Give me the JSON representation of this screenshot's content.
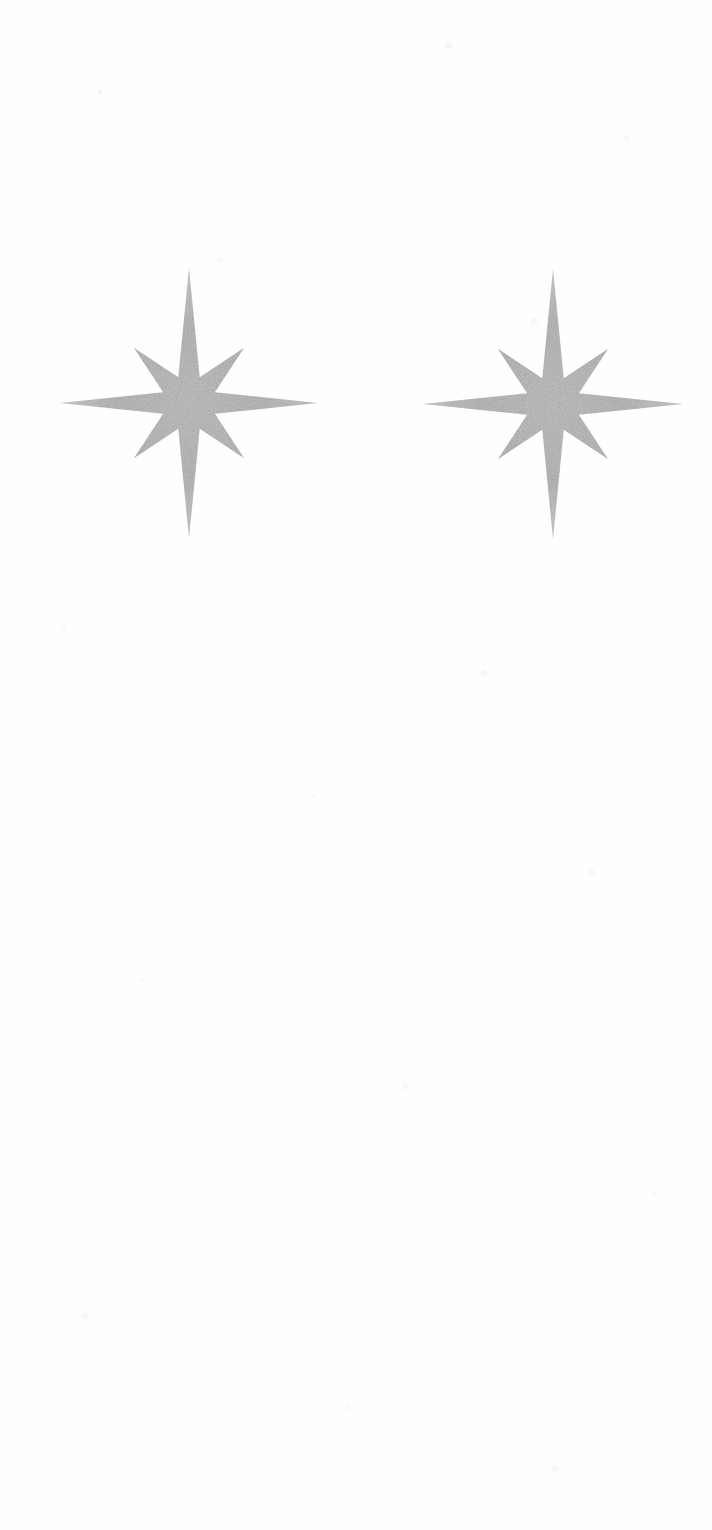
{
  "canvas": {
    "width": 712,
    "height": 1530,
    "background_color": "#fefeff",
    "paper_texture": "faint-scanned-paper-mottling"
  },
  "artwork": {
    "title": "Two eight-pointed sparkle stars",
    "description": "Two identical grainy grey eight-pointed sparkle glyphs side by side on a near-white scanned page, upper third of the sheet.",
    "item_count": 2,
    "fill_color": "#b9b9bb",
    "fill_color_light": "#d2d2d5",
    "fill_color_dark": "#a6a6a9",
    "texture": "grainy-speckled-grey"
  },
  "stars": [
    {
      "name": "sparkle-star-left",
      "center_x": 189,
      "center_y": 403,
      "points": 8,
      "outer_radius_vertical": 135,
      "outer_radius_horizontal": 129,
      "outer_radius_diagonal": 78,
      "inner_radius": 28,
      "bounds": {
        "left": 60,
        "top": 268,
        "right": 318,
        "bottom": 538
      }
    },
    {
      "name": "sparkle-star-right",
      "center_x": 553,
      "center_y": 404,
      "points": 8,
      "outer_radius_vertical": 135,
      "outer_radius_horizontal": 130,
      "outer_radius_diagonal": 78,
      "inner_radius": 28,
      "bounds": {
        "left": 423,
        "top": 269,
        "right": 683,
        "bottom": 540
      }
    }
  ]
}
